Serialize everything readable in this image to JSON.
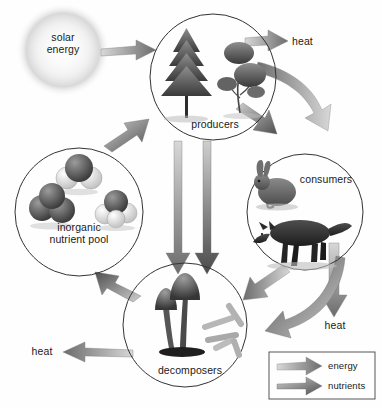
{
  "diagram": {
    "background_color": "#fefefe",
    "line_color": "#333333",
    "text_color": "#1a1a1a"
  },
  "source": {
    "label": "solar\nenergy",
    "name": "solar-energy",
    "glow_color": "#cfcfcf"
  },
  "nodes": [
    {
      "id": "producers",
      "label": "producers",
      "cx": 213,
      "cy": 77,
      "r": 63,
      "contents": [
        "conifer-tree",
        "flowering-shrub"
      ]
    },
    {
      "id": "consumers",
      "label": "consumers",
      "cx": 305,
      "cy": 212,
      "r": 58,
      "contents": [
        "rabbit",
        "fox"
      ]
    },
    {
      "id": "decomposers",
      "label": "decomposers",
      "cx": 185,
      "cy": 325,
      "r": 62,
      "contents": [
        "mushrooms",
        "bacteria-rods"
      ]
    },
    {
      "id": "nutrient-pool",
      "label": "inorganic\nnutrient pool",
      "cx": 79,
      "cy": 212,
      "r": 64,
      "contents": [
        "molecule-model-1",
        "molecule-model-2",
        "molecule-model-3"
      ]
    }
  ],
  "heat_outputs": [
    {
      "id": "heat-producers",
      "label": "heat",
      "x": 292,
      "y": 42,
      "direction": "right"
    },
    {
      "id": "heat-consumers",
      "label": "heat",
      "x": 333,
      "y": 320,
      "direction": "down"
    },
    {
      "id": "heat-decomposers",
      "label": "heat",
      "x": 26,
      "y": 352,
      "direction": "left"
    }
  ],
  "flows": [
    {
      "from": "solar-energy",
      "to": "producers",
      "type": "energy"
    },
    {
      "from": "producers",
      "to": "heat",
      "type": "energy"
    },
    {
      "from": "producers",
      "to": "consumers",
      "type": "energy"
    },
    {
      "from": "producers",
      "to": "consumers",
      "type": "nutrients"
    },
    {
      "from": "producers",
      "to": "decomposers",
      "type": "energy"
    },
    {
      "from": "producers",
      "to": "decomposers",
      "type": "nutrients"
    },
    {
      "from": "consumers",
      "to": "heat",
      "type": "energy"
    },
    {
      "from": "consumers",
      "to": "decomposers",
      "type": "energy"
    },
    {
      "from": "consumers",
      "to": "decomposers",
      "type": "nutrients"
    },
    {
      "from": "decomposers",
      "to": "heat",
      "type": "energy"
    },
    {
      "from": "decomposers",
      "to": "nutrient-pool",
      "type": "nutrients"
    },
    {
      "from": "nutrient-pool",
      "to": "producers",
      "type": "nutrients"
    }
  ],
  "legend": {
    "name": "legend-box",
    "items": [
      {
        "id": "energy",
        "label": "energy",
        "color": "#6e6e6e"
      },
      {
        "id": "nutrients",
        "label": "nutrients",
        "color": "#4a4a4a"
      }
    ]
  }
}
